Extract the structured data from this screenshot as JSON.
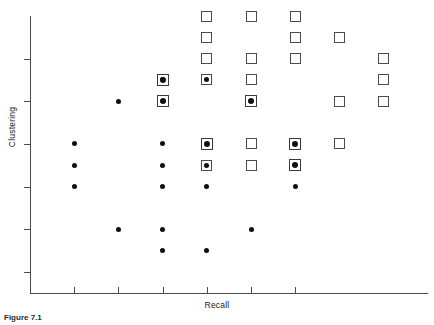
{
  "figure": {
    "caption_label": "Figure 7.1",
    "caption_text": "Recall",
    "background": "#ffffff",
    "ink_color": "#101010",
    "axis_color": "#4a4a4a"
  },
  "chart_data": {
    "type": "scatter",
    "title": "",
    "xlabel": "Recall",
    "ylabel": "Clustering",
    "grid": false,
    "legend": "none",
    "xlim": [
      0,
      9
    ],
    "ylim": [
      0,
      13
    ],
    "x_tick_values": [
      1,
      2,
      3,
      4,
      5,
      6
    ],
    "y_tick_values": [
      1,
      3,
      5,
      7,
      9,
      11
    ],
    "x_tick_labels": [
      "",
      "",
      "",
      "",
      "",
      ""
    ],
    "y_tick_labels": [
      "",
      "",
      "",
      "",
      "",
      ""
    ],
    "series": [
      {
        "name": "dot",
        "marker": "filled-circle",
        "color": "#101010",
        "points": [
          [
            1,
            7
          ],
          [
            1,
            6
          ],
          [
            1,
            5
          ],
          [
            2,
            9
          ],
          [
            2,
            3
          ],
          [
            3,
            10
          ],
          [
            3,
            7
          ],
          [
            3,
            6
          ],
          [
            3,
            5
          ],
          [
            3,
            3
          ],
          [
            3,
            2
          ],
          [
            4,
            10
          ],
          [
            4,
            6
          ],
          [
            4,
            5
          ],
          [
            4,
            2
          ],
          [
            5,
            3
          ],
          [
            6,
            5
          ]
        ]
      },
      {
        "name": "square",
        "marker": "open-square",
        "color": "#4b4b4b",
        "points": [
          [
            4,
            13
          ],
          [
            4,
            12
          ],
          [
            4,
            11
          ],
          [
            4,
            10
          ],
          [
            4,
            6
          ],
          [
            5,
            13
          ],
          [
            5,
            11
          ],
          [
            5,
            10
          ],
          [
            5,
            7
          ],
          [
            5,
            6
          ],
          [
            6,
            13
          ],
          [
            6,
            12
          ],
          [
            6,
            11
          ],
          [
            7,
            12
          ],
          [
            7,
            9
          ],
          [
            7,
            7
          ],
          [
            8,
            11
          ],
          [
            8,
            10
          ],
          [
            8,
            9
          ]
        ]
      },
      {
        "name": "square-with-dot",
        "marker": "open-square-with-filled-circle",
        "color": "#3a3a3a",
        "points": [
          [
            3,
            10
          ],
          [
            3,
            9
          ],
          [
            4,
            7
          ],
          [
            5,
            9
          ],
          [
            6,
            7
          ],
          [
            6,
            6
          ]
        ]
      }
    ]
  }
}
